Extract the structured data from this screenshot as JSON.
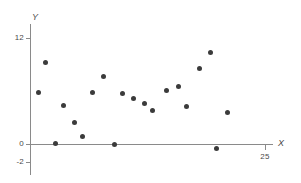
{
  "chart_data": {
    "type": "scatter",
    "title": "",
    "xlabel": "X",
    "ylabel": "Y",
    "xlim": [
      0,
      29
    ],
    "ylim": [
      -2.6,
      13.5
    ],
    "grid": false,
    "legend": null,
    "x_ticks": [
      {
        "value": 25,
        "label": "25"
      }
    ],
    "y_ticks": [
      {
        "value": 12,
        "label": "12"
      },
      {
        "value": 0,
        "label": "0"
      },
      {
        "value": -2,
        "label": "-2"
      }
    ],
    "marker": {
      "shape": "circle",
      "color": "#3b3b3b",
      "size": 5
    },
    "axis_color": "#8a8a8a",
    "points": [
      {
        "x": 0.9,
        "y": 5.8
      },
      {
        "x": 1.6,
        "y": 9.2
      },
      {
        "x": 2.7,
        "y": 0.1
      },
      {
        "x": 3.6,
        "y": 4.4
      },
      {
        "x": 4.7,
        "y": 2.4
      },
      {
        "x": 5.6,
        "y": 0.8
      },
      {
        "x": 6.7,
        "y": 5.8
      },
      {
        "x": 7.8,
        "y": 7.6
      },
      {
        "x": 9.0,
        "y": 0.0
      },
      {
        "x": 9.8,
        "y": 5.7
      },
      {
        "x": 11.0,
        "y": 5.2
      },
      {
        "x": 12.2,
        "y": 4.6
      },
      {
        "x": 13.0,
        "y": 3.8
      },
      {
        "x": 14.5,
        "y": 6.1
      },
      {
        "x": 15.8,
        "y": 6.5
      },
      {
        "x": 16.7,
        "y": 4.2
      },
      {
        "x": 18.0,
        "y": 8.6
      },
      {
        "x": 19.2,
        "y": 10.4
      },
      {
        "x": 19.8,
        "y": -0.5
      },
      {
        "x": 21.0,
        "y": 3.6
      }
    ]
  }
}
